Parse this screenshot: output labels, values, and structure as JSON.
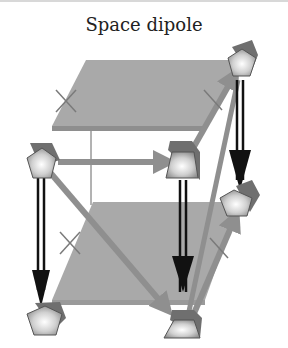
{
  "title": "Space dipole",
  "colors": {
    "plane": "#a9a9a9",
    "plane_edge": "#8a8a8a",
    "gray_arrow": "#8f8f8f",
    "black_arrow": "#111111",
    "node_fill_center": "#ffffff",
    "node_fill_edge": "#9a9a9a",
    "node_cap": "#6f6f6f"
  },
  "planes": [
    {
      "name": "top-plane",
      "cross_mark": true
    },
    {
      "name": "bottom-plane",
      "cross_mark": true
    }
  ],
  "nodes": [
    {
      "name": "top-left-node",
      "shape": "pentagon"
    },
    {
      "name": "top-right-node",
      "shape": "trapezoid"
    },
    {
      "name": "back-top-node",
      "shape": "pentagon"
    },
    {
      "name": "back-mid-node",
      "shape": "pentagon"
    },
    {
      "name": "bottom-left-node",
      "shape": "pentagon"
    },
    {
      "name": "bottom-right-node",
      "shape": "trapezoid"
    }
  ],
  "arrows": [
    {
      "from": "top-left-node",
      "to": "top-right-node",
      "style": "gray"
    },
    {
      "from": "top-left-node",
      "to": "bottom-right-node",
      "style": "gray"
    },
    {
      "from": "top-right-node",
      "to": "back-top-node",
      "style": "gray"
    },
    {
      "from": "bottom-right-node",
      "to": "back-top-node",
      "style": "gray"
    },
    {
      "from": "bottom-right-node",
      "to": "back-mid-node",
      "style": "gray"
    },
    {
      "from": "top-left-node",
      "to": "bottom-left-node",
      "style": "black-double"
    },
    {
      "from": "top-right-node",
      "to": "bottom-right-node",
      "style": "black-double"
    },
    {
      "from": "back-top-node",
      "to": "back-mid-node",
      "style": "black-double"
    }
  ]
}
